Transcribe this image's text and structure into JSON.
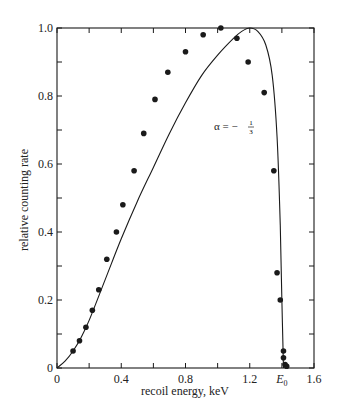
{
  "chart_data": {
    "type": "line",
    "title": "",
    "xlabel": "recoil energy, keV",
    "ylabel": "relative counting rate",
    "xlim": [
      0,
      1.6
    ],
    "ylim": [
      0,
      1.0
    ],
    "x_ticks": [
      0,
      0.2,
      0.4,
      0.6,
      0.8,
      1.0,
      1.2,
      1.4,
      1.6
    ],
    "x_tick_labels": [
      "0",
      "",
      "0.4",
      "",
      "0.8",
      "",
      "1.2",
      "E0",
      "1.6"
    ],
    "y_ticks": [
      0,
      0.1,
      0.2,
      0.3,
      0.4,
      0.5,
      0.6,
      0.7,
      0.8,
      0.9,
      1.0
    ],
    "y_tick_labels": [
      "0",
      "",
      "0.2",
      "",
      "0.4",
      "",
      "0.6",
      "",
      "0.8",
      "",
      "1.0"
    ],
    "grid": false,
    "legend": null,
    "annotations": [
      {
        "text": "α = −1/3",
        "x": 1.0,
        "y": 0.72
      },
      {
        "text": "E0",
        "x": 1.41,
        "y": 0,
        "note": "endpoint energy marker on x-axis"
      }
    ],
    "series": [
      {
        "name": "measured",
        "style": "points",
        "x": [
          0.1,
          0.14,
          0.18,
          0.22,
          0.26,
          0.31,
          0.37,
          0.41,
          0.48,
          0.54,
          0.61,
          0.69,
          0.8,
          0.91,
          1.02,
          1.12,
          1.19,
          1.29,
          1.35,
          1.37,
          1.39,
          1.41,
          1.41,
          1.42,
          1.43
        ],
        "y": [
          0.05,
          0.08,
          0.12,
          0.17,
          0.23,
          0.32,
          0.4,
          0.48,
          0.58,
          0.69,
          0.79,
          0.87,
          0.93,
          0.98,
          1.0,
          0.97,
          0.9,
          0.81,
          0.58,
          0.28,
          0.2,
          0.05,
          0.03,
          0.01,
          0.005
        ]
      },
      {
        "name": "theory (α = −1/3)",
        "style": "smooth-line",
        "x": [
          0,
          0.05,
          0.1,
          0.15,
          0.2,
          0.3,
          0.4,
          0.5,
          0.6,
          0.7,
          0.8,
          0.9,
          1.0,
          1.1,
          1.15,
          1.2,
          1.25,
          1.3,
          1.34,
          1.37,
          1.39,
          1.4,
          1.41
        ],
        "y": [
          0,
          0.02,
          0.05,
          0.09,
          0.14,
          0.26,
          0.38,
          0.49,
          0.59,
          0.69,
          0.78,
          0.86,
          0.92,
          0.97,
          0.99,
          1.0,
          0.99,
          0.95,
          0.86,
          0.68,
          0.42,
          0.2,
          0.0
        ]
      }
    ]
  },
  "labels": {
    "xlabel": "recoil energy, keV",
    "ylabel": "relative counting rate",
    "annotation_alpha": "α = −",
    "annotation_num": "1",
    "annotation_den": "3",
    "e0_label": "E",
    "e0_sub": "0"
  },
  "colors": {
    "ink": "#1a1a1a",
    "background": "#ffffff"
  }
}
